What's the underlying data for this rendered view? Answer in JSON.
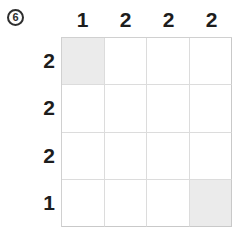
{
  "puzzle": {
    "badge": {
      "icon": "circled-number-icon",
      "label": "6"
    },
    "grid": {
      "rows": 4,
      "cols": 4,
      "fill_color": "#ebebeb",
      "empty_color": "#ffffff",
      "line_color": "#dcdcdc",
      "cells": [
        [
          1,
          0,
          0,
          0
        ],
        [
          0,
          0,
          0,
          0
        ],
        [
          0,
          0,
          0,
          0
        ],
        [
          0,
          0,
          0,
          1
        ]
      ]
    },
    "column_clues": [
      {
        "label": "1"
      },
      {
        "label": "2"
      },
      {
        "label": "2"
      },
      {
        "label": "2"
      }
    ],
    "row_clues": [
      {
        "label": "2"
      },
      {
        "label": "2"
      },
      {
        "label": "2"
      },
      {
        "label": "1"
      }
    ]
  }
}
